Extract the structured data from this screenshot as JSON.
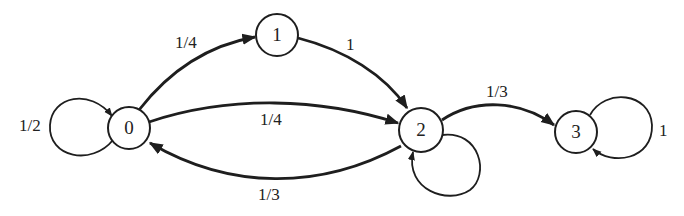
{
  "diagram": {
    "type": "markov-chain-state-diagram",
    "nodes": [
      {
        "id": "0",
        "label": "0"
      },
      {
        "id": "1",
        "label": "1"
      },
      {
        "id": "2",
        "label": "2"
      },
      {
        "id": "3",
        "label": "3"
      }
    ],
    "edges": [
      {
        "from": "0",
        "to": "0",
        "label": "1/2"
      },
      {
        "from": "0",
        "to": "1",
        "label": "1/4"
      },
      {
        "from": "0",
        "to": "2",
        "label": "1/4"
      },
      {
        "from": "1",
        "to": "2",
        "label": "1"
      },
      {
        "from": "2",
        "to": "0",
        "label": "1/3"
      },
      {
        "from": "2",
        "to": "2",
        "label": ""
      },
      {
        "from": "2",
        "to": "3",
        "label": "1/3"
      },
      {
        "from": "3",
        "to": "3",
        "label": "1"
      }
    ]
  },
  "colors": {
    "stroke": "#1e1e1e",
    "background": "#ffffff"
  }
}
